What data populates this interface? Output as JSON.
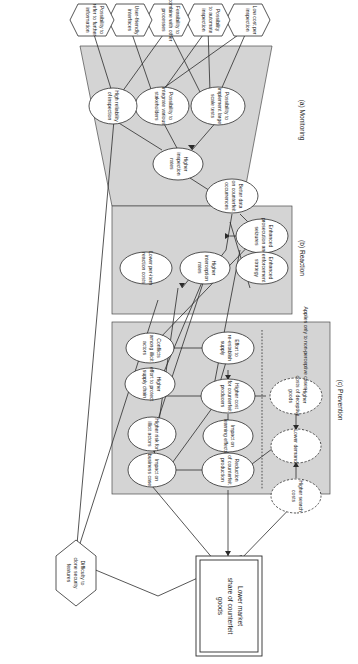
{
  "figure": {
    "orientation": "rotated-90-clockwise",
    "sections": [
      {
        "id": "monitoring",
        "label": "(a) Monitoring"
      },
      {
        "id": "reaction",
        "label": "(b) Reaction"
      },
      {
        "id": "prevention",
        "label": "(c) Prevention"
      }
    ],
    "note": "Applies only to non-perceptive cases",
    "goal": "Lower market\nshare of counterfeit\ngoods",
    "goal_lines": [
      "Lower market",
      "share of counterfeit",
      "goods"
    ],
    "colors": {
      "panel_fill": "#d4d4d4",
      "node_fill": "#ffffff",
      "stroke": "#2b2b2b",
      "page_background": "#ffffff"
    },
    "requirements": [
      {
        "id": "req-low-cost",
        "lines": [
          "Low cost per",
          "inspection"
        ]
      },
      {
        "id": "req-automate",
        "lines": [
          "Possibility",
          "to automate",
          "inspection"
        ]
      },
      {
        "id": "req-combine",
        "lines": [
          "Feasibility to",
          "combine with other",
          "processes"
        ]
      },
      {
        "id": "req-interfaces",
        "lines": [
          "User-friendly",
          "interfaces"
        ]
      },
      {
        "id": "req-refer-info",
        "lines": [
          "Possibility to",
          "refer to further",
          "information"
        ]
      }
    ],
    "security_requirement": {
      "id": "req-clone",
      "lines": [
        "Difficulty to",
        "clone security",
        "features"
      ]
    },
    "monitoring_nodes": [
      {
        "id": "poss-large-scale",
        "lines": [
          "Possibility to",
          "implement large",
          "scale tests"
        ]
      },
      {
        "id": "poss-integrate",
        "lines": [
          "Possibility to",
          "integrate various",
          "stakeholders"
        ]
      },
      {
        "id": "high-reliability",
        "lines": [
          "High reliability",
          "of inspection"
        ]
      },
      {
        "id": "higher-inspection",
        "lines": [
          "Higher",
          "inspection",
          "rates"
        ]
      },
      {
        "id": "better-data",
        "lines": [
          "Better data",
          "on counterfeit",
          "occurrences"
        ]
      }
    ],
    "reaction_nodes": [
      {
        "id": "enhanced-prosecution",
        "lines": [
          "Enhanced",
          "prosecution and",
          "seizures"
        ]
      },
      {
        "id": "enhanced-enforcement",
        "lines": [
          "Enhanced",
          "enforcement",
          "strategy"
        ]
      },
      {
        "id": "higher-interception",
        "lines": [
          "Higher",
          "interception",
          "rates"
        ]
      },
      {
        "id": "lower-per-item",
        "lines": [
          "Lower per-item",
          "reaction costs"
        ]
      }
    ],
    "prevention_nodes": [
      {
        "id": "conflicts-illicit",
        "lines": [
          "Conflicts",
          "among illicit",
          "actors"
        ]
      },
      {
        "id": "higher-effort-sc",
        "lines": [
          "Higher",
          "effort to protect",
          "supply chain"
        ]
      },
      {
        "id": "higher-risk-illicit",
        "lines": [
          "Higher risk for",
          "illicit actors"
        ]
      },
      {
        "id": "impact-business",
        "lines": [
          "Impact on",
          "business case"
        ]
      },
      {
        "id": "effort-reestablish",
        "lines": [
          "Effort to",
          "re-establish",
          "supply"
        ]
      },
      {
        "id": "higher-cost-cf",
        "lines": [
          "Higher cost",
          "for counterfeit",
          "producers"
        ]
      },
      {
        "id": "impact-learning",
        "lines": [
          "Impact on",
          "learning effects"
        ]
      },
      {
        "id": "reduction-cf-prod",
        "lines": [
          "Reduction",
          "of counterfeit",
          "production"
        ]
      }
    ],
    "deceptive_nodes": [
      {
        "id": "higher-costs-deceptive",
        "lines": [
          "Higher",
          "costs of deceptive",
          "goods"
        ]
      },
      {
        "id": "lower-demand",
        "lines": [
          "Lower demand"
        ]
      },
      {
        "id": "higher-search-costs",
        "lines": [
          "Higher search",
          "costs"
        ]
      }
    ]
  }
}
